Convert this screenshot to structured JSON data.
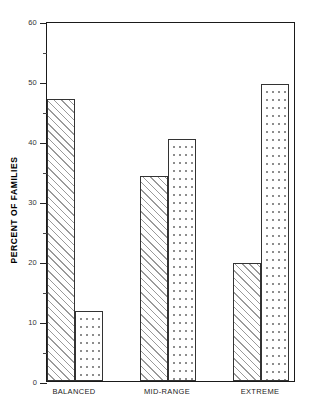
{
  "chart_data": {
    "type": "bar",
    "title": "",
    "subtitle": "",
    "xlabel": "",
    "ylabel": "PERCENT OF FAMILIES",
    "categories": [
      "BALANCED",
      "MID-RANGE",
      "EXTREME"
    ],
    "series": [
      {
        "name": "series-1-hatched",
        "pattern": "diagonal-hatch",
        "values": [
          47.0,
          34.2,
          19.7
        ]
      },
      {
        "name": "series-2-dotted",
        "pattern": "dotted",
        "values": [
          11.7,
          40.3,
          49.5
        ]
      }
    ],
    "ylim": [
      0,
      60
    ],
    "yticks": [
      0,
      10,
      20,
      30,
      40,
      50,
      60
    ],
    "ytick_labels": [
      "0",
      "10",
      "20",
      "30",
      "40",
      "50",
      "60"
    ],
    "yminor_ticks": [
      5,
      15,
      25,
      35,
      45,
      55
    ],
    "grid": false,
    "legend": "none",
    "legend_position": "none",
    "colors": {
      "axis": "#1a1a1a",
      "bar_outline": "#333333",
      "hatch": "#9a9a9a",
      "dots": "#8d8d8d",
      "background": "#ffffff",
      "text": "#222222"
    }
  },
  "axis": {
    "y_title": "PERCENT OF FAMILIES",
    "tick_labels": [
      "60",
      "50",
      "40",
      "30",
      "20",
      "10",
      "0"
    ]
  },
  "categories": {
    "items": [
      {
        "label": "BALANCED"
      },
      {
        "label": "MID-RANGE"
      },
      {
        "label": "EXTREME"
      }
    ]
  }
}
